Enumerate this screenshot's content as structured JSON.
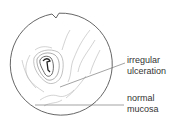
{
  "figure": {
    "labels": [
      {
        "line1": "irregular",
        "line2": "ulceration"
      },
      {
        "line1": "normal",
        "line2": "mucosa"
      }
    ],
    "colors": {
      "outline": "#555555",
      "sketch": "#aaaaaa",
      "ulcer": "#333333",
      "text": "#333333"
    }
  }
}
